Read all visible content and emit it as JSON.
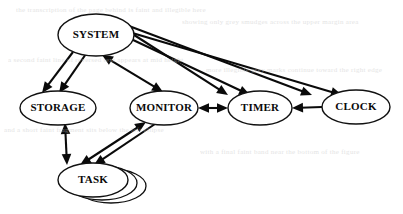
{
  "diagram": {
    "type": "directed-graph",
    "background_color": "#ffffff",
    "stroke_color": "#0a0a0a",
    "nodes": [
      {
        "id": "system",
        "label": "SYSTEM",
        "cx": 96,
        "cy": 35,
        "rx": 38,
        "ry": 21,
        "shape": "ellipse",
        "font_size": 11
      },
      {
        "id": "storage",
        "label": "STORAGE",
        "cx": 58,
        "cy": 108,
        "rx": 38,
        "ry": 17,
        "shape": "ellipse",
        "font_size": 11
      },
      {
        "id": "monitor",
        "label": "MONITOR",
        "cx": 164,
        "cy": 108,
        "rx": 34,
        "ry": 17,
        "shape": "ellipse",
        "font_size": 11
      },
      {
        "id": "timer",
        "label": "TIMER",
        "cx": 260,
        "cy": 108,
        "rx": 32,
        "ry": 17,
        "shape": "ellipse",
        "font_size": 11
      },
      {
        "id": "clock",
        "label": "CLOCK",
        "cx": 356,
        "cy": 107,
        "rx": 34,
        "ry": 17,
        "shape": "ellipse",
        "font_size": 11
      },
      {
        "id": "task",
        "label": "TASK",
        "cx": 93,
        "cy": 180,
        "rx": 35,
        "ry": 17,
        "shape": "ellipse-stack",
        "stack_count": 3,
        "stack_offset_x": 9,
        "stack_offset_y": 3,
        "font_size": 11
      }
    ],
    "edges": [
      {
        "from": "system",
        "to": "storage",
        "direction": "forward",
        "label": ""
      },
      {
        "from": "system",
        "to": "storage",
        "direction": "forward",
        "label": ""
      },
      {
        "from": "system",
        "to": "monitor",
        "direction": "bidirectional",
        "label": ""
      },
      {
        "from": "system",
        "to": "timer",
        "direction": "forward",
        "label": ""
      },
      {
        "from": "system",
        "to": "timer",
        "direction": "forward",
        "label": ""
      },
      {
        "from": "system",
        "to": "clock",
        "direction": "forward",
        "label": ""
      },
      {
        "from": "system",
        "to": "clock",
        "direction": "forward",
        "label": ""
      },
      {
        "from": "monitor",
        "to": "timer",
        "direction": "bidirectional",
        "label": ""
      },
      {
        "from": "clock",
        "to": "timer",
        "direction": "forward",
        "label": ""
      },
      {
        "from": "storage",
        "to": "task",
        "direction": "bidirectional",
        "label": ""
      },
      {
        "from": "monitor",
        "to": "task",
        "direction": "bidirectional",
        "label": ""
      },
      {
        "from": "monitor",
        "to": "task",
        "direction": "forward",
        "label": ""
      }
    ]
  },
  "artifacts": {
    "description": "faint scanner bleed-through text lines",
    "lines": [
      {
        "text": "the transcription of the page behind is faint and illegible here",
        "x": 16,
        "y": 6
      },
      {
        "text": "showing only grey smudges across the upper margin area",
        "x": 182,
        "y": 18
      },
      {
        "text": "a second faint line of reversed text appears at mid height",
        "x": 8,
        "y": 56
      },
      {
        "text": "more illegible grey marks continue toward the right edge",
        "x": 206,
        "y": 66
      },
      {
        "text": "and a short faint fragment sits below the left ellipse",
        "x": 4,
        "y": 126
      },
      {
        "text": "with a final faint band near the bottom of the figure",
        "x": 200,
        "y": 148
      }
    ]
  }
}
